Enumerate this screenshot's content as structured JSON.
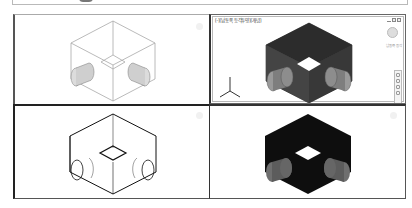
{
  "top_strip": {
    "present": true
  },
  "viewports": {
    "top_left": {
      "view": "wireframe",
      "style": "2D Wireframe"
    },
    "top_right": {
      "title": "[-][남동쪽 등각투영][개념]",
      "active": true,
      "window_buttons": [
        "minimize",
        "restore",
        "close"
      ],
      "viewcube_label": "남동쪽 등각",
      "axis_labels": {
        "x": "X",
        "y": "Y",
        "z": "Z"
      }
    },
    "bottom_left": {
      "view": "hidden"
    },
    "bottom_right": {
      "view": "shaded"
    }
  },
  "colors": {
    "frame": "#3a3a3a",
    "wire": "#9a9a9a",
    "solid_dark": "#1a1a1a",
    "conceptual_body": "#3b3b3b",
    "cylinder": "#8c8c8c"
  }
}
